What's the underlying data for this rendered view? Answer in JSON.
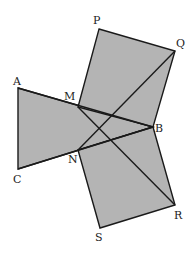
{
  "diagram": {
    "type": "geometry",
    "fill_color": "#b4b4b4",
    "stroke_color": "#1a1a1a",
    "points": {
      "A": [
        18,
        88
      ],
      "M": [
        78,
        107
      ],
      "B": [
        153,
        127
      ],
      "N": [
        78,
        150
      ],
      "C": [
        18,
        169
      ],
      "P": [
        99,
        29
      ],
      "Q": [
        175,
        51
      ],
      "R": [
        175,
        205
      ],
      "S": [
        100,
        228
      ]
    },
    "labels": [
      {
        "text": "P",
        "x": 93,
        "y": 24
      },
      {
        "text": "Q",
        "x": 176,
        "y": 47
      },
      {
        "text": "A",
        "x": 13,
        "y": 85
      },
      {
        "text": "M",
        "x": 64,
        "y": 100
      },
      {
        "text": "B",
        "x": 155,
        "y": 132
      },
      {
        "text": "N",
        "x": 68,
        "y": 163
      },
      {
        "text": "C",
        "x": 13,
        "y": 183
      },
      {
        "text": "R",
        "x": 174,
        "y": 219
      },
      {
        "text": "S",
        "x": 95,
        "y": 241
      }
    ]
  }
}
